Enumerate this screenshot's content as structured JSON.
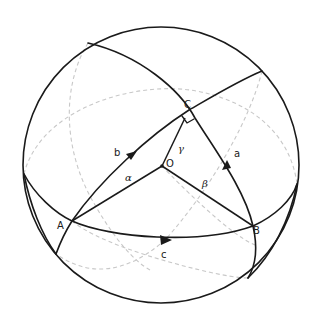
{
  "figure": {
    "sphere": {
      "cx": 161,
      "cy": 165,
      "r": 138
    },
    "colors": {
      "solid": "#1a1a1a",
      "hidden": "#c8c8c8",
      "background": "#ffffff"
    },
    "points": {
      "A": {
        "label": "A",
        "x": 72,
        "y": 221
      },
      "B": {
        "label": "B",
        "x": 253,
        "y": 226
      },
      "C": {
        "label": "C",
        "x": 189,
        "y": 110
      },
      "O": {
        "label": "O",
        "x": 162,
        "y": 166
      }
    },
    "sides": {
      "a": {
        "label": "a",
        "from": "B",
        "to": "C"
      },
      "b": {
        "label": "b",
        "from": "A",
        "to": "C"
      },
      "c": {
        "label": "c",
        "from": "A",
        "to": "B"
      }
    },
    "central_angles": {
      "alpha": {
        "label": "α",
        "between": [
          "O",
          "A"
        ]
      },
      "beta": {
        "label": "β",
        "between": [
          "O",
          "B"
        ]
      },
      "gamma": {
        "label": "γ",
        "between": [
          "O",
          "C"
        ]
      }
    },
    "annotations": {
      "right_angle_at": "C"
    }
  }
}
